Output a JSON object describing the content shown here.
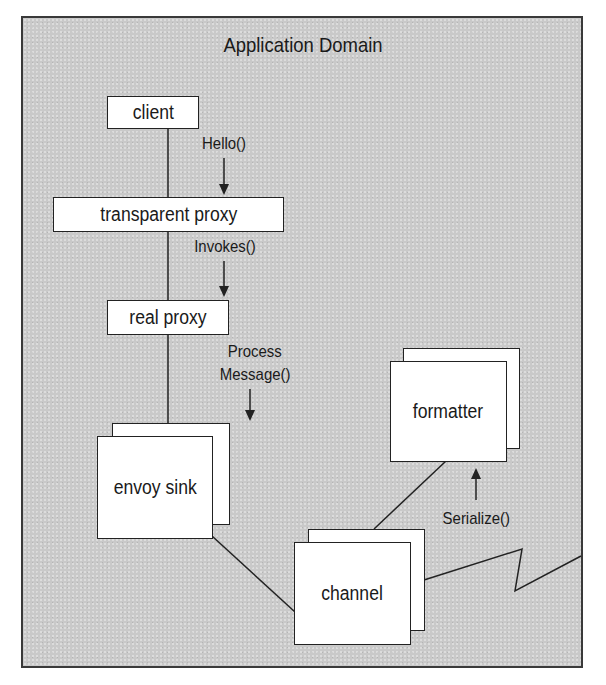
{
  "diagram": {
    "title": "Application Domain",
    "nodes": {
      "client": {
        "label": "client"
      },
      "transparent_proxy": {
        "label": "transparent proxy"
      },
      "real_proxy": {
        "label": "real proxy"
      },
      "envoy_sink": {
        "label": "envoy sink",
        "stacked": true
      },
      "formatter": {
        "label": "formatter",
        "stacked": true
      },
      "channel": {
        "label": "channel",
        "stacked": true
      }
    },
    "edges": [
      {
        "from": "client",
        "to": "transparent_proxy",
        "label": "Hello()",
        "arrow": "down"
      },
      {
        "from": "transparent_proxy",
        "to": "real_proxy",
        "label": "Invokes()",
        "arrow": "down"
      },
      {
        "from": "real_proxy",
        "to": "envoy_sink",
        "label_line1": "Process",
        "label_line2": "Message()",
        "arrow": "down"
      },
      {
        "from": "envoy_sink",
        "to": "channel",
        "label": ""
      },
      {
        "from": "channel",
        "to": "formatter",
        "label": "Serialize()",
        "arrow": "up"
      },
      {
        "from": "channel",
        "to": "outside",
        "style": "zigzag",
        "label": ""
      }
    ],
    "colors": {
      "background": "#c9c9c9",
      "box_fill": "#ffffff",
      "stroke": "#222222",
      "text": "#1a1a1a"
    }
  }
}
